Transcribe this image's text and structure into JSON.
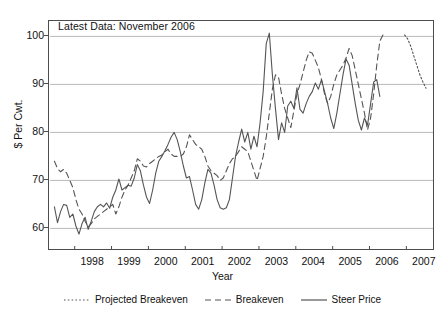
{
  "annotation": "Latest Data: November 2006",
  "axes": {
    "ylabel": "$ Per Cwt.",
    "xlabel": "Year",
    "yticks": [
      "100",
      "90",
      "80",
      "70",
      "60"
    ],
    "xticks": [
      "1998",
      "1999",
      "2000",
      "2001",
      "2002",
      "2003",
      "2004",
      "2005",
      "2006",
      "2007"
    ]
  },
  "legend": {
    "items": [
      {
        "label": "Projected Breakeven",
        "style": "dotted",
        "color": "#555555"
      },
      {
        "label": "Breakeven",
        "style": "dashed",
        "color": "#555555"
      },
      {
        "label": "Steer Price",
        "style": "solid",
        "color": "#555555"
      }
    ]
  },
  "chart_data": {
    "type": "line",
    "title": "",
    "annotation": "Latest Data: November 2006",
    "xlabel": "Year",
    "ylabel": "$ Per Cwt.",
    "xlim": [
      1997.4,
      1997.4
    ],
    "ylim": [
      55.5,
      103
    ],
    "grid": "horizontal",
    "legend_position": "bottom",
    "yticks": [
      60,
      70,
      80,
      90,
      100
    ],
    "xticks": [
      1998,
      1999,
      2000,
      2001,
      2002,
      2003,
      2004,
      2005,
      2006,
      2007
    ],
    "x_start": 1997.45,
    "x_step": 0.0833,
    "series": [
      {
        "name": "Steer Price",
        "style": "solid",
        "color": "#555555",
        "x_start": 1997.45,
        "values": [
          64.5,
          61.2,
          63.5,
          65.0,
          64.8,
          62.3,
          63.0,
          60.5,
          58.8,
          61.0,
          62.3,
          59.8,
          61.5,
          63.5,
          64.5,
          65.0,
          64.5,
          65.3,
          64.2,
          66.5,
          68.0,
          70.3,
          68.0,
          68.5,
          69.0,
          68.8,
          70.5,
          73.3,
          72.0,
          69.0,
          66.5,
          65.2,
          68.0,
          71.5,
          74.0,
          75.0,
          76.2,
          77.5,
          79.0,
          80.0,
          78.5,
          76.0,
          73.0,
          70.5,
          70.8,
          68.0,
          65.0,
          64.0,
          66.0,
          69.5,
          72.3,
          71.5,
          69.0,
          66.0,
          64.3,
          64.0,
          64.3,
          66.0,
          70.5,
          75.0,
          78.0,
          80.7,
          78.0,
          80.0,
          76.5,
          79.2,
          77.0,
          82.0,
          88.5,
          98.5,
          100.7,
          92.0,
          85.0,
          78.5,
          82.0,
          80.0,
          85.5,
          86.5,
          85.0,
          89.3,
          84.8,
          84.0,
          86.0,
          87.5,
          88.5,
          90.3,
          89.0,
          91.0,
          88.5,
          86.0,
          83.0,
          80.8,
          84.0,
          88.0,
          92.0,
          95.3,
          94.0,
          90.0,
          86.0,
          82.5,
          80.5,
          83.0,
          81.5,
          86.0,
          90.5,
          91.0,
          87.5
        ]
      },
      {
        "name": "Breakeven",
        "style": "dashed",
        "color": "#555555",
        "x_start": 1997.45,
        "values": [
          74.0,
          72.5,
          71.8,
          72.3,
          71.5,
          70.0,
          68.5,
          66.0,
          64.0,
          63.0,
          61.5,
          60.3,
          61.0,
          62.0,
          62.5,
          63.0,
          63.5,
          64.0,
          64.5,
          65.0,
          63.0,
          64.5,
          66.5,
          68.0,
          69.0,
          70.5,
          72.0,
          74.5,
          74.0,
          73.0,
          72.8,
          73.5,
          74.0,
          74.5,
          75.0,
          75.3,
          76.0,
          76.5,
          75.5,
          75.0,
          75.0,
          75.0,
          75.5,
          77.0,
          79.5,
          78.5,
          77.5,
          77.0,
          76.5,
          75.0,
          73.0,
          72.0,
          71.5,
          71.0,
          70.0,
          70.5,
          72.0,
          73.5,
          74.5,
          75.0,
          76.0,
          77.0,
          76.5,
          76.0,
          74.0,
          72.0,
          70.0,
          72.5,
          75.0,
          79.0,
          84.0,
          89.0,
          92.0,
          91.5,
          88.0,
          85.0,
          83.0,
          81.0,
          84.5,
          88.0,
          90.0,
          92.5,
          95.0,
          96.8,
          96.5,
          95.0,
          93.5,
          91.0,
          88.0,
          86.0,
          87.5,
          90.0,
          92.0,
          93.0,
          94.0,
          95.5,
          97.5,
          96.0,
          93.0,
          90.0,
          87.0,
          84.0,
          80.5,
          83.0,
          88.0,
          94.0,
          99.0,
          100.3
        ]
      },
      {
        "name": "Projected Breakeven",
        "style": "dotted",
        "color": "#555555",
        "x_start": 2006.95,
        "values": [
          100.3,
          99.5,
          98.0,
          96.0,
          94.0,
          92.0,
          90.5,
          89.2
        ]
      }
    ]
  }
}
